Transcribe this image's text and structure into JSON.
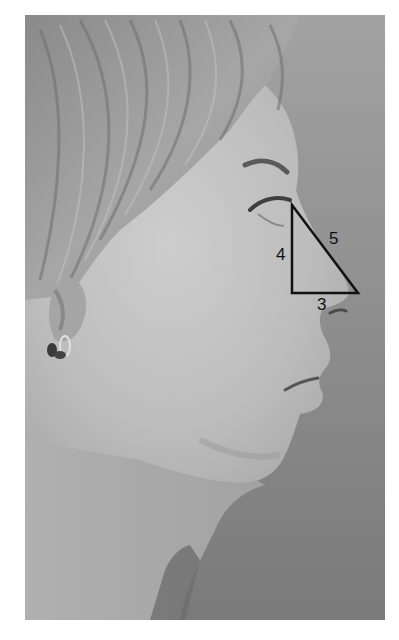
{
  "figure": {
    "colors": {
      "background": "#8c8c8c",
      "skin": "#c2c2c2",
      "hair": "#9c9c9c",
      "triangle_stroke": "#111111"
    },
    "triangle": {
      "vertices": {
        "top": [
          292,
          205
        ],
        "bottom_left": [
          292,
          293
        ],
        "bottom_right": [
          358,
          293
        ]
      },
      "labels": {
        "vertical": "4",
        "hypotenuse": "5",
        "base": "3"
      }
    }
  },
  "caption": {
    "text": ""
  }
}
